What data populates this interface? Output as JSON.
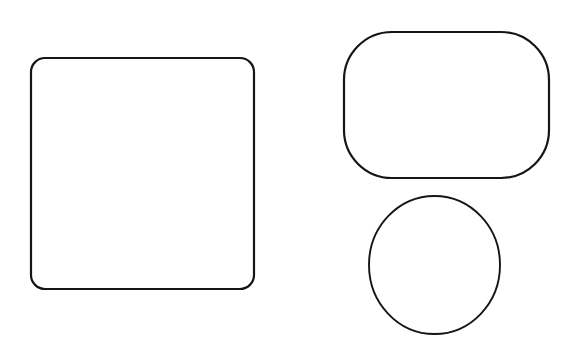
{
  "canvas": {
    "width": 581,
    "height": 352,
    "background_color": "#ffffff",
    "description": "Three hand-drawn black outline shapes on a plain white background"
  },
  "style": {
    "stroke_color": "#151515",
    "fill": "none",
    "stroke_width": 2
  },
  "shapes": [
    {
      "id": "rounded-square",
      "name": "rounded-square",
      "type": "rounded-rectangle",
      "x": 31,
      "y": 58,
      "width": 223,
      "height": 231,
      "corner_radius": 14,
      "stroke_width": 2.2,
      "fill": "none",
      "stroke_color": "#151515"
    },
    {
      "id": "rounded-rectangle",
      "name": "rounded-rectangle",
      "type": "rounded-rectangle",
      "x": 344,
      "y": 32,
      "width": 205,
      "height": 146,
      "corner_radius": 48,
      "stroke_width": 2.2,
      "fill": "none",
      "stroke_color": "#151515"
    },
    {
      "id": "circle",
      "name": "circle",
      "type": "ellipse",
      "center_x": 434.5,
      "center_y": 265,
      "radius_x": 65.5,
      "radius_y": 69,
      "stroke_width": 1.9,
      "fill": "none",
      "stroke_color": "#151515"
    }
  ]
}
